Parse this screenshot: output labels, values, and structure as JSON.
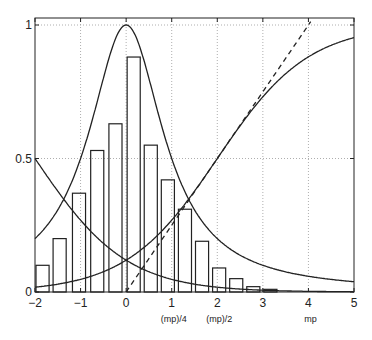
{
  "chart_data": {
    "type": "bar",
    "title": "",
    "xlabel": "",
    "ylabel": "",
    "xlim": [
      -2,
      5
    ],
    "ylim": [
      0,
      1
    ],
    "grid": true,
    "x_ticks": [
      -2,
      -1,
      0,
      1,
      2,
      3,
      4,
      5
    ],
    "x_tick_labels": [
      "−2",
      "−1",
      "0",
      "1",
      "2",
      "3",
      "4",
      "5"
    ],
    "x_annotations": [
      {
        "x": 1,
        "label": "(mp)/4"
      },
      {
        "x": 2,
        "label": "(mp)/2"
      },
      {
        "x": 4,
        "label": "mp"
      }
    ],
    "y_ticks": [
      0,
      0.5,
      1
    ],
    "y_tick_labels": [
      "0",
      "0.5",
      "1"
    ],
    "histogram": {
      "bin_width": 0.375,
      "bin_starts": [
        -2.0,
        -1.625,
        -1.2,
        -0.8,
        -0.4,
        0.0,
        0.375,
        0.75,
        1.125,
        1.5,
        1.875,
        2.25,
        2.625,
        3.0
      ],
      "values": [
        0.1,
        0.2,
        0.37,
        0.53,
        0.63,
        0.88,
        0.55,
        0.42,
        0.31,
        0.19,
        0.09,
        0.05,
        0.02,
        0.01
      ]
    },
    "series": [
      {
        "name": "bell curve",
        "style": "solid",
        "formula": "1/(1+x^2)",
        "sample_x": [
          -2,
          -1,
          0,
          1,
          2,
          3,
          4,
          5
        ],
        "sample_y": [
          0.2,
          0.5,
          1.0,
          0.5,
          0.2,
          0.1,
          0.06,
          0.04
        ]
      },
      {
        "name": "decreasing sigmoid",
        "style": "solid",
        "formula": "1/(1+exp(x+2))",
        "sample_x": [
          -2,
          -1,
          0,
          1,
          2,
          3
        ],
        "sample_y": [
          0.5,
          0.27,
          0.12,
          0.05,
          0.02,
          0.007
        ]
      },
      {
        "name": "increasing sigmoid",
        "style": "solid",
        "formula": "1/(1+exp(-(x-2)))",
        "sample_x": [
          -2,
          -1,
          0,
          1,
          2,
          3,
          4,
          5
        ],
        "sample_y": [
          0.02,
          0.05,
          0.12,
          0.27,
          0.5,
          0.73,
          0.88,
          0.95
        ]
      },
      {
        "name": "tangent line",
        "style": "dashed",
        "formula": "x/4",
        "sample_x": [
          0,
          4
        ],
        "sample_y": [
          0,
          1
        ]
      }
    ],
    "legend": null
  }
}
